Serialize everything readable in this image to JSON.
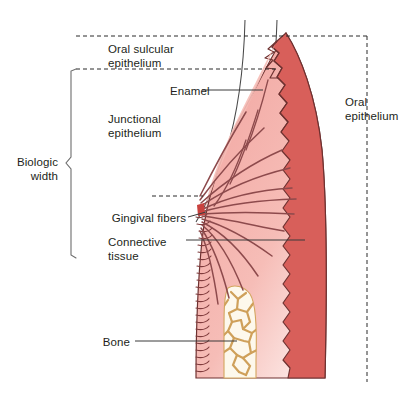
{
  "figure": {
    "type": "anatomical-diagram",
    "background_color": "#ffffff"
  },
  "colors": {
    "oral_epithelium_fill": "#d85f5a",
    "connective_tissue_fill": "#f3aaa4",
    "connective_tissue_fill_light": "#fbe3e0",
    "fiber_stroke": "#8d4a4c",
    "outline_stroke": "#5b2b2b",
    "bone_stroke": "#cfa05a",
    "bone_fill": "#fdf6e3",
    "tooth_outline": "#3a3a3a",
    "dashed_guide": "#2b2b2b",
    "bracket": "#6d6d6d",
    "leader_line": "#3a3a3a",
    "text": "#231f20"
  },
  "labels": {
    "oral_sulcular_epithelium": "Oral sulcular\nepithelium",
    "enamel": "Enamel",
    "junctional_epithelium": "Junctional\nepithelium",
    "biologic_width": "Biologic\nwidth",
    "gingival_fibers": "Gingival fibers",
    "connective_tissue": "Connective\ntissue",
    "bone": "Bone",
    "oral_epithelium": "Oral\nepithelium"
  },
  "annotations": {
    "dashed_horizontal_lines": 3,
    "dashed_vertical_line": 1,
    "bracket_regions": [
      "Biologic width"
    ],
    "leader_lines": [
      "Enamel",
      "Gingival fibers",
      "Connective tissue",
      "Bone"
    ]
  }
}
